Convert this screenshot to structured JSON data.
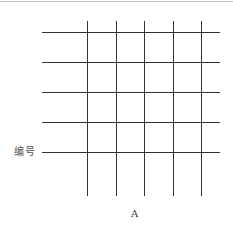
{
  "diagram": {
    "row_label": "编号",
    "column_label": "A",
    "line_color": "#333333",
    "grid": {
      "horizontal_lines_y": [
        32,
        62,
        92,
        122,
        152
      ],
      "horizontal_left_x": 42,
      "horizontal_right_x": 220,
      "vertical_lines_x": [
        87,
        116,
        144,
        173,
        201
      ],
      "vertical_top_y": 21,
      "vertical_bottom_y": 196
    }
  }
}
